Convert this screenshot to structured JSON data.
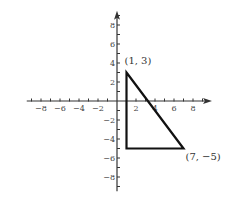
{
  "chart_data": {
    "type": "line",
    "title": "",
    "xlabel": "",
    "ylabel": "",
    "xlim": [
      -9.5,
      10
    ],
    "ylim": [
      -9.5,
      9.5
    ],
    "grid": false,
    "x_ticks": [
      -8,
      -6,
      -4,
      -2,
      2,
      4,
      6,
      8
    ],
    "y_ticks": [
      -8,
      -6,
      -4,
      -2,
      2,
      4,
      6,
      8
    ],
    "x_tick_labels": [
      "−8",
      "−6",
      "−4",
      "−2",
      "2",
      "4",
      "6",
      "8"
    ],
    "y_tick_labels": [
      "−8",
      "−6",
      "−4",
      "−2",
      "2",
      "4",
      "6",
      "8"
    ],
    "minor_ticks_every": 1,
    "series": [
      {
        "name": "triangle",
        "closed": true,
        "points": [
          {
            "x": 1,
            "y": 3
          },
          {
            "x": 7,
            "y": -5
          },
          {
            "x": 1,
            "y": -5
          }
        ]
      }
    ],
    "annotations": [
      {
        "text": "(1, 3)",
        "x": 1,
        "y": 3
      },
      {
        "text": "(7, −5)",
        "x": 7,
        "y": -5
      }
    ]
  },
  "layout": {
    "origin_px": [
      117,
      101
    ],
    "unit_px": 9.5,
    "axis_color": "#333333",
    "shape_color": "#111111"
  }
}
